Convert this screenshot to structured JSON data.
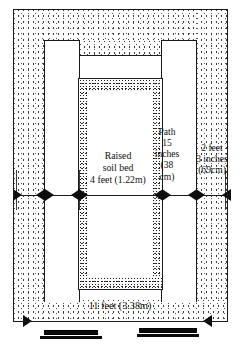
{
  "diagram": {
    "type": "architectural-plan-dimension-drawing",
    "view": "plan",
    "line_color": "#1a1a1a",
    "fill_color": "#ffffff",
    "texture": "stipple"
  },
  "labels": {
    "bed": {
      "line1": "Raised",
      "line2": "soil bed",
      "line3": "4 feet (1.22m)"
    },
    "path": {
      "line1": "Path",
      "line2": "15",
      "line3": "inches",
      "line4": "(38",
      "line5": "cm)"
    },
    "side_border": {
      "line1": "2 feet",
      "line2": "3 inches",
      "line3": "(69cm)"
    },
    "overall_width": "11 feet (3.38m)"
  },
  "dimensions": [
    {
      "name": "raised-soil-bed",
      "imperial": "4 feet",
      "metric": "1.22m"
    },
    {
      "name": "path",
      "imperial": "15 inches",
      "metric": "38 cm"
    },
    {
      "name": "side-border",
      "imperial": "2 feet 3 inches",
      "metric": "69cm"
    },
    {
      "name": "overall-width",
      "imperial": "11 feet",
      "metric": "3.38m"
    }
  ]
}
